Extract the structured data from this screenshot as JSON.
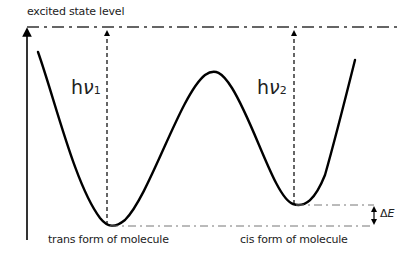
{
  "diagram": {
    "labels": {
      "excited_state": "excited state level",
      "trans": "trans form of molecule",
      "cis": "cis form of molecule",
      "delta_e_symbol": "Δ",
      "delta_e_var": "E"
    },
    "photon_1": {
      "h": "h",
      "nu": "ν",
      "sub": "1"
    },
    "photon_2": {
      "h": "h",
      "nu": "ν",
      "sub": "2"
    },
    "colors": {
      "curve": "#000000",
      "dash": "#555555",
      "text": "#222222"
    }
  }
}
